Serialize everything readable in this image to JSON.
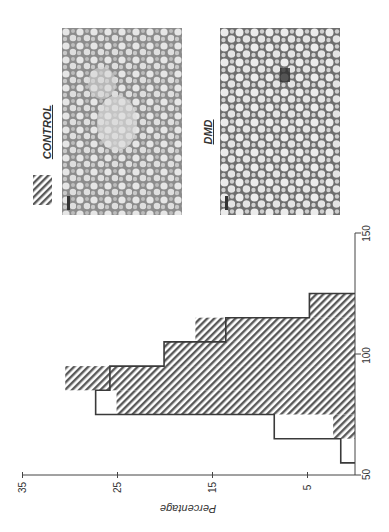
{
  "legend": {
    "items": [
      {
        "label": "CONTROL",
        "style": "hatched"
      }
    ]
  },
  "photos": [
    {
      "label": "CONTROL"
    },
    {
      "label": "DMD"
    }
  ],
  "axes": {
    "percentage_title": "Percentage",
    "percentage_ticks": [
      "35",
      "25",
      "15",
      "5"
    ],
    "size_ticks": [
      "50",
      "100",
      "150"
    ]
  },
  "colors": {
    "ink": "#3a3a3a",
    "hatch": "#5a5a5a",
    "background": "#ffffff"
  },
  "chart_data": {
    "type": "bar",
    "orientation": "rotated-90 (size axis vertical on right, percentage axis horizontal at bottom, increasing leftward)",
    "title": "",
    "xlabel": "",
    "ylabel": "Percentage",
    "bin_edges": [
      55,
      65,
      75,
      85,
      95,
      105,
      115,
      125
    ],
    "categories": [
      "55-65",
      "65-75",
      "75-85",
      "85-95",
      "95-105",
      "105-115",
      "115-125"
    ],
    "series": [
      {
        "name": "CONTROL",
        "style": "hatched fill",
        "values": [
          0,
          2.3,
          25.1,
          30.5,
          20.1,
          16.8,
          4.8
        ]
      },
      {
        "name": "DMD",
        "style": "outline",
        "values": [
          1.5,
          8.5,
          27.3,
          25.8,
          20.1,
          13.6,
          4.8
        ]
      }
    ],
    "size_axis_range": [
      50,
      150
    ],
    "percentage_axis_range": [
      0,
      35
    ],
    "percentage_ticks": [
      35,
      25,
      15,
      5
    ],
    "size_ticks": [
      50,
      100,
      150
    ],
    "grid": false,
    "legend_position": "top-left (hatched swatch labeled CONTROL)"
  }
}
